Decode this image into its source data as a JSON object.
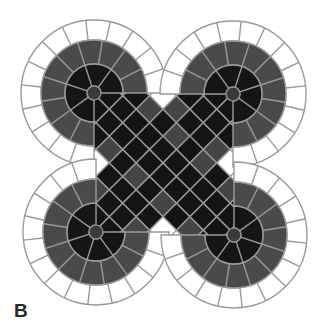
{
  "figure": {
    "panel_label": "B",
    "colors": {
      "background": "#ffffff",
      "outer_ring": "#ffffff",
      "mid_ring": "#4a4a4a",
      "inner_core": "#151515",
      "hub": "#3a3a3a",
      "grout": "#9a9a9a",
      "band_black": "#141414",
      "band_gray": "#454545",
      "band_white": "#ffffff"
    },
    "lobes": [
      {
        "name": "top-left",
        "cx": 94,
        "cy": 93,
        "start_deg": 90,
        "sweep_deg": 270
      },
      {
        "name": "top-right",
        "cx": 233,
        "cy": 94,
        "start_deg": 180,
        "sweep_deg": 270
      },
      {
        "name": "bottom-left",
        "cx": 96,
        "cy": 232,
        "start_deg": 0,
        "sweep_deg": 270
      },
      {
        "name": "bottom-right",
        "cx": 234,
        "cy": 235,
        "start_deg": 270,
        "sweep_deg": 270
      }
    ],
    "radii": {
      "hub": 7,
      "inner": 29,
      "mid": 53,
      "outer": 73
    },
    "spokes": {
      "inner": 5,
      "mid": 10,
      "outer": 14
    },
    "tile_size": 19
  }
}
